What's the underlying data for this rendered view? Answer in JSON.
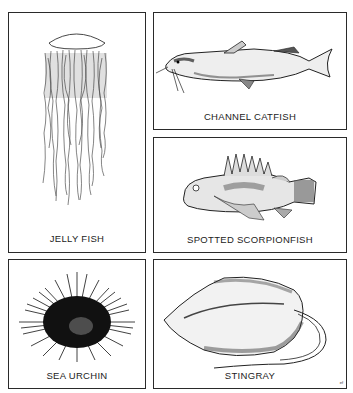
{
  "panels": [
    {
      "id": "jelly",
      "caption": "JELLY FISH",
      "icon": "jellyfish-illustration"
    },
    {
      "id": "catfish",
      "caption": "CHANNEL CATFISH",
      "icon": "catfish-illustration"
    },
    {
      "id": "scorpionfish",
      "caption": "SPOTTED SCORPIONFISH",
      "icon": "scorpionfish-illustration"
    },
    {
      "id": "urchin",
      "caption": "SEA URCHIN",
      "icon": "sea-urchin-illustration"
    },
    {
      "id": "stingray",
      "caption": "STINGRAY",
      "icon": "stingray-illustration"
    }
  ],
  "signature": "ef",
  "colors": {
    "ink": "#222222",
    "paper": "#ffffff",
    "border": "#2a2a2a"
  }
}
